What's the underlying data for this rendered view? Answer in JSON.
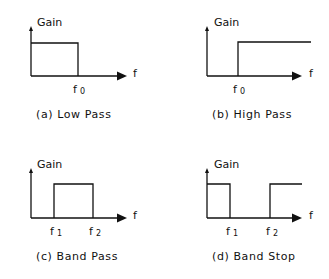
{
  "diagram": {
    "colors": {
      "line": "#111111",
      "background": "#ffffff"
    },
    "panels": [
      {
        "id": "a",
        "y_label": "Gain",
        "x_label": "f",
        "ticks": [
          {
            "main": "f",
            "sub": "0"
          }
        ],
        "caption": "(a) Low Pass",
        "type": "low-pass"
      },
      {
        "id": "b",
        "y_label": "Gain",
        "x_label": "f",
        "ticks": [
          {
            "main": "f",
            "sub": "0"
          }
        ],
        "caption": "(b) High Pass",
        "type": "high-pass"
      },
      {
        "id": "c",
        "y_label": "Gain",
        "x_label": "f",
        "ticks": [
          {
            "main": "f",
            "sub": "1"
          },
          {
            "main": "f",
            "sub": "2"
          }
        ],
        "caption": "(c) Band Pass",
        "type": "band-pass"
      },
      {
        "id": "d",
        "y_label": "Gain",
        "x_label": "f",
        "ticks": [
          {
            "main": "f",
            "sub": "1"
          },
          {
            "main": "f",
            "sub": "2"
          }
        ],
        "caption": "(d) Band Stop",
        "type": "band-stop"
      }
    ]
  }
}
